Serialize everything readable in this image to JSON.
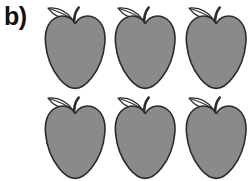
{
  "figure": {
    "panel_label": "b)",
    "background_color": "#ffffff",
    "label_color": "#111111",
    "item_name": "apple",
    "item_count": 6,
    "rows": 2,
    "columns": 3,
    "apple_fill_color": "#8a8a8a",
    "apple_outline_color": "#2b2b2b",
    "leaf_fill_color": "#ffffff",
    "leaf_outline_color": "#2b2b2b",
    "stem_color": "#2b2b2b",
    "apples": [
      {
        "id": "apple-1",
        "row": 1,
        "column": 1,
        "shade": "gray"
      },
      {
        "id": "apple-2",
        "row": 1,
        "column": 2,
        "shade": "gray"
      },
      {
        "id": "apple-3",
        "row": 1,
        "column": 3,
        "shade": "gray"
      },
      {
        "id": "apple-4",
        "row": 2,
        "column": 1,
        "shade": "gray"
      },
      {
        "id": "apple-5",
        "row": 2,
        "column": 2,
        "shade": "gray"
      },
      {
        "id": "apple-6",
        "row": 2,
        "column": 3,
        "shade": "gray"
      }
    ]
  }
}
